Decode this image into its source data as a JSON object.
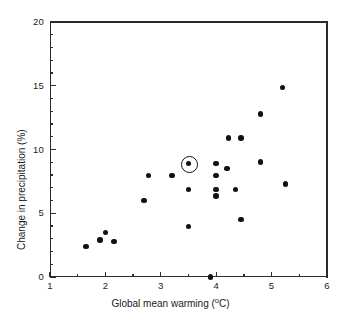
{
  "chart_data": {
    "type": "scatter",
    "title": "",
    "xlabel": "Global mean warming (°C)",
    "ylabel": "Change in precipitation (%)",
    "xlabel_text": "Global mean warming (",
    "xlabel_unit": "o",
    "xlabel_tail": "C)",
    "ylabel_text": "Change in precipitation (%)",
    "xlim": [
      1,
      6
    ],
    "ylim": [
      0,
      20
    ],
    "xticks": [
      1,
      2,
      3,
      4,
      5,
      6
    ],
    "xtick_labels": [
      "1",
      "2",
      "3",
      "4",
      "5",
      "6"
    ],
    "xticks_minor": [
      1.5,
      2.5,
      3.5,
      4.5,
      5.5
    ],
    "yticks": [
      0,
      5,
      10,
      15,
      20
    ],
    "ytick_labels": [
      "0",
      "5",
      "10",
      "15",
      "20"
    ],
    "yticks_minor": [
      1,
      2,
      3,
      4,
      6,
      7,
      8,
      9,
      11,
      12,
      13,
      14,
      16,
      17,
      18,
      19
    ],
    "grid": false,
    "legend": null,
    "marker_color": "#111111",
    "axis_color": "#2b2b2b",
    "background": "#ffffff",
    "points": [
      {
        "x": 1.65,
        "y": 2.4
      },
      {
        "x": 1.9,
        "y": 2.9
      },
      {
        "x": 2.0,
        "y": 3.5
      },
      {
        "x": 2.15,
        "y": 2.8
      },
      {
        "x": 2.7,
        "y": 6.0
      },
      {
        "x": 2.78,
        "y": 7.95
      },
      {
        "x": 3.2,
        "y": 7.95
      },
      {
        "x": 3.5,
        "y": 8.9,
        "highlighted": true
      },
      {
        "x": 3.5,
        "y": 6.85
      },
      {
        "x": 3.5,
        "y": 3.95
      },
      {
        "x": 3.9,
        "y": 0.0
      },
      {
        "x": 4.0,
        "y": 8.9
      },
      {
        "x": 4.0,
        "y": 7.95
      },
      {
        "x": 4.0,
        "y": 6.85
      },
      {
        "x": 4.0,
        "y": 6.35
      },
      {
        "x": 4.22,
        "y": 10.9
      },
      {
        "x": 4.2,
        "y": 8.5
      },
      {
        "x": 4.45,
        "y": 10.9
      },
      {
        "x": 4.35,
        "y": 6.85
      },
      {
        "x": 4.45,
        "y": 4.5
      },
      {
        "x": 4.8,
        "y": 9.0
      },
      {
        "x": 4.8,
        "y": 12.8
      },
      {
        "x": 5.2,
        "y": 14.85
      },
      {
        "x": 5.25,
        "y": 7.3
      }
    ],
    "highlighted_point": {
      "x": 3.5,
      "y": 8.9,
      "annotation": "circled"
    },
    "n_points": 24
  }
}
